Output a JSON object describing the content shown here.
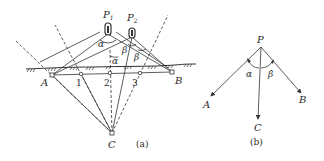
{
  "figure_a": {
    "caption": "(a)",
    "poles": [
      {
        "label": "P",
        "sub": "1"
      },
      {
        "label": "P",
        "sub": "2"
      }
    ],
    "points": {
      "A": "A",
      "B": "B",
      "C": "C",
      "p1": "1",
      "p2": "2",
      "p3": "3"
    },
    "angles": {
      "alpha_top": "α",
      "alpha_mid": "α",
      "beta_left": "β",
      "beta_right": "β"
    }
  },
  "figure_b": {
    "caption": "(b)",
    "labels": {
      "P": "P",
      "A": "A",
      "B": "B",
      "C": "C",
      "alpha": "α",
      "beta": "β"
    }
  }
}
